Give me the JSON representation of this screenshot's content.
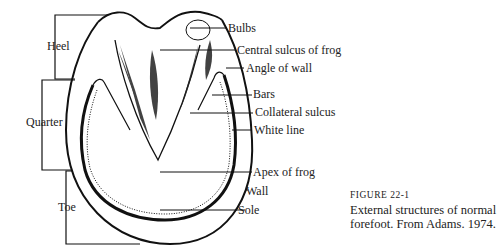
{
  "figure": {
    "number_label": "FIGURE 22-1",
    "caption_line1": "External structures of normal",
    "caption_line2": "forefoot. From Adams. 1974."
  },
  "regions": {
    "heel": "Heel",
    "quarter": "Quarter",
    "toe": "Toe"
  },
  "labels": {
    "bulbs": "Bulbs",
    "central_sulcus": "Central sulcus of frog",
    "angle_of_wall": "Angle of wall",
    "bars": "Bars",
    "collateral_sulcus": "Collateral sulcus",
    "white_line": "White line",
    "apex_of_frog": "Apex of frog",
    "wall": "Wall",
    "sole": "Sole"
  }
}
